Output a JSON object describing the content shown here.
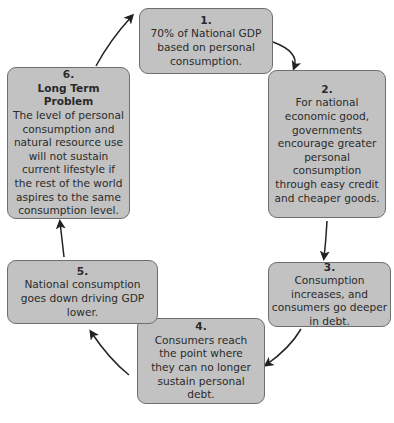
{
  "diagram": {
    "type": "cycle",
    "steps": [
      {
        "number": "1.",
        "title": "",
        "text": "70% of National GDP based on personal consumption."
      },
      {
        "number": "2.",
        "title": "",
        "text": "For national economic good, governments encourage greater personal consumption through easy credit and cheaper goods."
      },
      {
        "number": "3.",
        "title": "",
        "text": "Consumption increases, and consumers go deeper in debt."
      },
      {
        "number": "4.",
        "title": "",
        "text": "Consumers reach the point where they can no longer sustain personal debt."
      },
      {
        "number": "5.",
        "title": "",
        "text": "National consumption goes down driving GDP lower."
      },
      {
        "number": "6.",
        "title": "Long Term Problem",
        "text": "The level of personal consumption and natural resource use will not sustain current lifestyle if the rest of the world aspires to the same consumption level."
      }
    ],
    "arrows": [
      {
        "from": "1",
        "to": "2"
      },
      {
        "from": "2",
        "to": "3"
      },
      {
        "from": "3",
        "to": "4"
      },
      {
        "from": "4",
        "to": "5"
      },
      {
        "from": "5",
        "to": "6"
      },
      {
        "from": "6",
        "to": "1"
      }
    ],
    "colors": {
      "box_fill": "#c2c2c2",
      "box_border": "#6e6e6e",
      "arrow": "#222222",
      "text": "#2a2a2a"
    }
  }
}
